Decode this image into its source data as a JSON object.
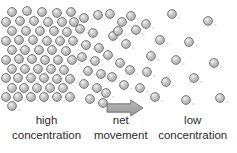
{
  "diagram": {
    "background_color": "#ffffff",
    "width": 237,
    "height": 153
  },
  "labels": {
    "left": {
      "line1": "high",
      "line2": "concentration"
    },
    "center": {
      "line1": "net",
      "line2": "movement"
    },
    "right": {
      "line1": "low",
      "line2": "concentration"
    }
  },
  "arrow": {
    "name": "net-movement-arrow",
    "direction": "right",
    "fill_color": "#a8a8a8",
    "stroke_color": "#6b6b6b",
    "x": 107,
    "y": 100,
    "width": 36,
    "height": 16
  },
  "particle_style": {
    "fill_color": "#b4b4b4",
    "stroke_color": "#6e6e6e",
    "highlight_color": "#f2f2f2",
    "radius": 4.4,
    "tick_color": "#c9c9c9"
  },
  "chart_data": {
    "type": "scatter",
    "xlabel": "",
    "ylabel": "",
    "xlim": [
      0,
      237
    ],
    "ylim": [
      0,
      153
    ],
    "grid": false,
    "legend": "none",
    "annotations": [
      {
        "text": "high concentration",
        "x": 52,
        "y": 133
      },
      {
        "text": "net movement",
        "x": 124,
        "y": 133
      },
      {
        "text": "low concentration",
        "x": 188,
        "y": 133
      },
      {
        "text": "arrow",
        "x": 125,
        "y": 108
      }
    ],
    "series": [
      {
        "name": "high-concentration-region",
        "density": "high",
        "count": 56,
        "points": [
          [
            12,
            12
          ],
          [
            27,
            11
          ],
          [
            42,
            12
          ],
          [
            57,
            13
          ],
          [
            71,
            12
          ],
          [
            6,
            22
          ],
          [
            20,
            21
          ],
          [
            34,
            21
          ],
          [
            48,
            22
          ],
          [
            62,
            22
          ],
          [
            74,
            22
          ],
          [
            12,
            31
          ],
          [
            26,
            31
          ],
          [
            40,
            31
          ],
          [
            54,
            31
          ],
          [
            67,
            32
          ],
          [
            6,
            41
          ],
          [
            19,
            40
          ],
          [
            33,
            40
          ],
          [
            47,
            41
          ],
          [
            60,
            41
          ],
          [
            73,
            41
          ],
          [
            12,
            50
          ],
          [
            25,
            50
          ],
          [
            39,
            50
          ],
          [
            52,
            50
          ],
          [
            66,
            51
          ],
          [
            6,
            60
          ],
          [
            19,
            59
          ],
          [
            32,
            59
          ],
          [
            45,
            60
          ],
          [
            58,
            60
          ],
          [
            72,
            60
          ],
          [
            12,
            69
          ],
          [
            25,
            69
          ],
          [
            38,
            69
          ],
          [
            51,
            69
          ],
          [
            64,
            70
          ],
          [
            6,
            78
          ],
          [
            18,
            78
          ],
          [
            31,
            78
          ],
          [
            44,
            78
          ],
          [
            57,
            79
          ],
          [
            70,
            79
          ],
          [
            12,
            88
          ],
          [
            24,
            88
          ],
          [
            37,
            88
          ],
          [
            50,
            88
          ],
          [
            63,
            88
          ],
          [
            6,
            97
          ],
          [
            18,
            97
          ],
          [
            31,
            97
          ],
          [
            44,
            97
          ],
          [
            57,
            97
          ],
          [
            70,
            97
          ],
          [
            12,
            106
          ]
        ]
      },
      {
        "name": "transition-region",
        "density": "medium",
        "count": 26,
        "points": [
          [
            84,
            18
          ],
          [
            98,
            15
          ],
          [
            80,
            29
          ],
          [
            93,
            33
          ],
          [
            86,
            45
          ],
          [
            99,
            48
          ],
          [
            82,
            57
          ],
          [
            95,
            61
          ],
          [
            88,
            71
          ],
          [
            101,
            74
          ],
          [
            84,
            84
          ],
          [
            97,
            88
          ],
          [
            90,
            99
          ],
          [
            103,
            103
          ],
          [
            110,
            14
          ],
          [
            122,
            22
          ],
          [
            113,
            36
          ],
          [
            126,
            44
          ],
          [
            108,
            55
          ],
          [
            120,
            63
          ],
          [
            112,
            77
          ],
          [
            124,
            85
          ],
          [
            106,
            93
          ],
          [
            118,
            31
          ],
          [
            131,
            16
          ],
          [
            130,
            70
          ]
        ]
      },
      {
        "name": "low-concentration-region",
        "density": "low",
        "count": 16,
        "points": [
          [
            146,
            24
          ],
          [
            172,
            14
          ],
          [
            208,
            21
          ],
          [
            160,
            40
          ],
          [
            189,
            42
          ],
          [
            151,
            56
          ],
          [
            176,
            60
          ],
          [
            214,
            63
          ],
          [
            147,
            72
          ],
          [
            194,
            78
          ],
          [
            166,
            82
          ],
          [
            155,
            97
          ],
          [
            186,
            100
          ],
          [
            220,
            98
          ],
          [
            136,
            30
          ],
          [
            140,
            88
          ]
        ]
      }
    ]
  }
}
